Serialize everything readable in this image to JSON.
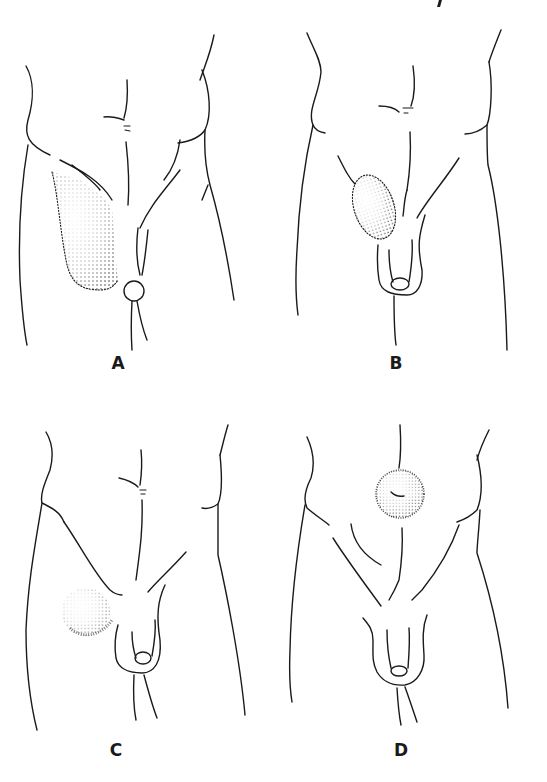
{
  "figure": {
    "panels": [
      {
        "id": "A",
        "label": "A",
        "description": "large stippled swelling extending from groin into scrotum on right side of figure"
      },
      {
        "id": "B",
        "label": "B",
        "description": "oval stippled swelling above scrotum in inguinal region"
      },
      {
        "id": "C",
        "label": "C",
        "description": "round faint stippled swelling below inguinal ligament on upper thigh"
      },
      {
        "id": "D",
        "label": "D",
        "description": "round stippled swelling at the umbilicus"
      }
    ],
    "colors": {
      "line": "#1a1a1a",
      "background": "#ffffff"
    }
  }
}
